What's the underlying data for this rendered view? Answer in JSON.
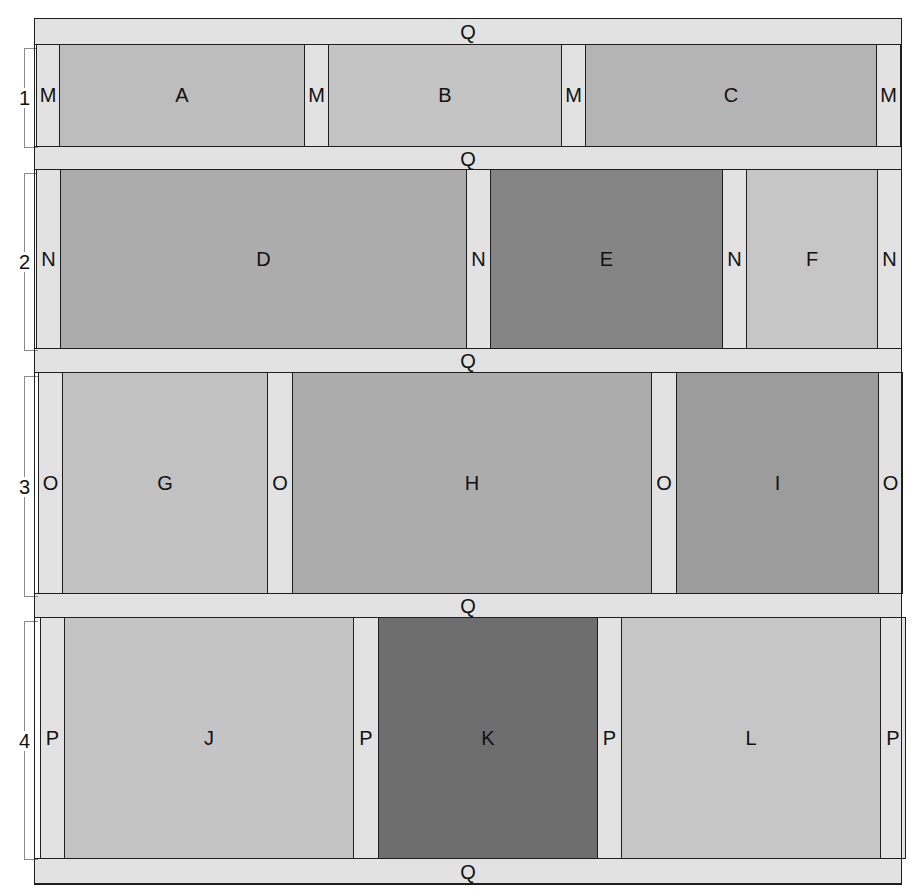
{
  "diagram": {
    "type": "quilt-layout",
    "frame": {
      "x": 34,
      "y": 18,
      "w": 868,
      "h": 866
    },
    "colors": {
      "strip": "#e2e2e2",
      "border": "#1e1e1e",
      "A": "#bdbdbd",
      "B": "#c4c4c4",
      "C": "#b4b4b4",
      "D": "#acacac",
      "E": "#858585",
      "F": "#c6c6c6",
      "G": "#c2c2c2",
      "H": "#acacac",
      "I": "#9c9c9c",
      "J": "#c4c4c4",
      "K": "#6e6e6e",
      "L": "#c6c6c6"
    },
    "horizontal_strips": [
      {
        "label": "Q",
        "y": 18,
        "h": 26
      },
      {
        "label": "Q",
        "y": 146,
        "h": 23
      },
      {
        "label": "Q",
        "y": 348,
        "h": 24
      },
      {
        "label": "Q",
        "y": 593,
        "h": 24
      },
      {
        "label": "Q",
        "y": 858,
        "h": 26
      }
    ],
    "rows": [
      {
        "number": "1",
        "y": 44,
        "h": 102,
        "bracket": {
          "y": 48,
          "h": 100
        },
        "sashing_label": "M",
        "sashing": [
          {
            "x": 36,
            "w": 23
          },
          {
            "x": 304,
            "w": 24
          },
          {
            "x": 561,
            "w": 24
          },
          {
            "x": 876,
            "w": 24
          }
        ],
        "pieces": [
          {
            "label": "A",
            "x": 59,
            "w": 245,
            "color": "#bdbdbd"
          },
          {
            "label": "B",
            "x": 328,
            "w": 233,
            "color": "#c4c4c4"
          },
          {
            "label": "C",
            "x": 585,
            "w": 291,
            "color": "#b4b4b4"
          }
        ]
      },
      {
        "number": "2",
        "y": 169,
        "h": 179,
        "bracket": {
          "y": 173,
          "h": 178
        },
        "sashing_label": "N",
        "sashing": [
          {
            "x": 36,
            "w": 24
          },
          {
            "x": 466,
            "w": 24
          },
          {
            "x": 722,
            "w": 24
          },
          {
            "x": 877,
            "w": 24
          }
        ],
        "pieces": [
          {
            "label": "D",
            "x": 60,
            "w": 406,
            "color": "#acacac"
          },
          {
            "label": "E",
            "x": 490,
            "w": 232,
            "color": "#858585"
          },
          {
            "label": "F",
            "x": 746,
            "w": 131,
            "color": "#c6c6c6"
          }
        ]
      },
      {
        "number": "3",
        "y": 372,
        "h": 221,
        "bracket": {
          "y": 376,
          "h": 221
        },
        "sashing_label": "O",
        "sashing": [
          {
            "x": 38,
            "w": 24
          },
          {
            "x": 267,
            "w": 25
          },
          {
            "x": 651,
            "w": 25
          },
          {
            "x": 878,
            "w": 24
          }
        ],
        "pieces": [
          {
            "label": "G",
            "x": 62,
            "w": 205,
            "color": "#c2c2c2"
          },
          {
            "label": "H",
            "x": 292,
            "w": 359,
            "color": "#acacac"
          },
          {
            "label": "I",
            "x": 676,
            "w": 202,
            "color": "#9c9c9c"
          }
        ]
      },
      {
        "number": "4",
        "y": 617,
        "h": 241,
        "bracket": {
          "y": 621,
          "h": 239
        },
        "sashing_label": "P",
        "sashing": [
          {
            "x": 40,
            "w": 24
          },
          {
            "x": 353,
            "w": 25
          },
          {
            "x": 597,
            "w": 24
          },
          {
            "x": 880,
            "w": 25
          }
        ],
        "pieces": [
          {
            "label": "J",
            "x": 64,
            "w": 289,
            "color": "#c4c4c4"
          },
          {
            "label": "K",
            "x": 378,
            "w": 219,
            "color": "#6e6e6e"
          },
          {
            "label": "L",
            "x": 621,
            "w": 259,
            "color": "#c6c6c6"
          }
        ]
      }
    ]
  },
  "labels": {
    "q": "Q",
    "rows": [
      "1",
      "2",
      "3",
      "4"
    ],
    "sashing": [
      "M",
      "N",
      "O",
      "P"
    ],
    "pieces": [
      "A",
      "B",
      "C",
      "D",
      "E",
      "F",
      "G",
      "H",
      "I",
      "J",
      "K",
      "L"
    ]
  }
}
